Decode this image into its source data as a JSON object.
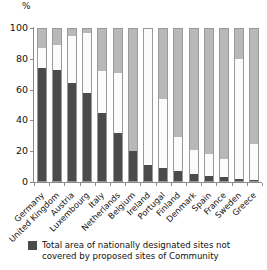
{
  "chart_data": {
    "type": "bar",
    "title": "",
    "xlabel": "",
    "ylabel": "%",
    "ylim": [
      0,
      100
    ],
    "yticks": [
      0,
      20,
      40,
      60,
      80,
      100
    ],
    "ytick_labels": [
      "0",
      "20",
      "40",
      "60",
      "80",
      "100"
    ],
    "grid": false,
    "stacked": true,
    "legend_position": "bottom-left",
    "categories": [
      "Germany",
      "United Kingdom",
      "Austria",
      "Luxembourg",
      "Italy",
      "Netherlands",
      "Belgium",
      "Ireland",
      "Portugal",
      "Finland",
      "Denmark",
      "Spain",
      "France",
      "Sweden",
      "Greece"
    ],
    "series": [
      {
        "name": "Total area of nationally designated sites not covered by proposed sites of Community",
        "color": "#4b4b4b",
        "values": [
          74,
          73,
          64,
          58,
          45,
          32,
          20,
          11,
          9,
          7,
          5,
          4,
          3,
          2,
          1
        ]
      },
      {
        "name": "middle-segment",
        "color": "#fbfbfb",
        "values": [
          13,
          16,
          31,
          39,
          27,
          39,
          0,
          89,
          45,
          22,
          16,
          14,
          12,
          78,
          24
        ]
      },
      {
        "name": "top-segment",
        "color": "#b8b8b8",
        "values": [
          13,
          11,
          5,
          3,
          28,
          29,
          80,
          0,
          46,
          71,
          79,
          82,
          85,
          20,
          75
        ]
      }
    ]
  },
  "legend": {
    "label": "Total area of nationally designated sites not covered by proposed sites of Community"
  },
  "axis": {
    "unit": "%"
  }
}
